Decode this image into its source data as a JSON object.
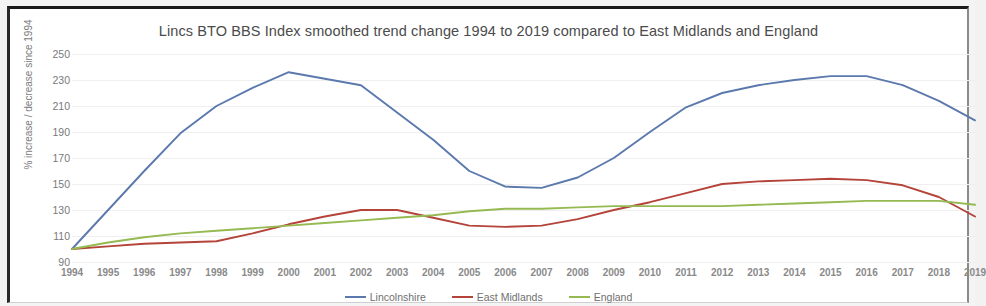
{
  "chart_data": {
    "type": "line",
    "title": "Lincs BTO BBS Index smoothed trend change 1994 to 2019 compared to East Midlands and England",
    "xlabel": "",
    "ylabel": "% increase / decrease since 1994",
    "ylim": [
      90,
      250
    ],
    "ytick_step": 20,
    "yticks": [
      250,
      230,
      210,
      190,
      170,
      150,
      130,
      110,
      90
    ],
    "grid": true,
    "legend_position": "bottom-center",
    "categories": [
      "1994",
      "1995",
      "1996",
      "1997",
      "1998",
      "1999",
      "2000",
      "2001",
      "2002",
      "2003",
      "2004",
      "2005",
      "2006",
      "2007",
      "2008",
      "2009",
      "2010",
      "2011",
      "2012",
      "2013",
      "2014",
      "2015",
      "2016",
      "2017",
      "2018",
      "2019"
    ],
    "series": [
      {
        "name": "Lincolnshire",
        "color": "#5b79ad",
        "values": [
          100,
          130,
          160,
          189,
          210,
          224,
          236,
          231,
          226,
          205,
          184,
          160,
          148,
          147,
          155,
          170,
          190,
          209,
          220,
          226,
          230,
          233,
          233,
          226,
          214,
          199
        ]
      },
      {
        "name": "East Midlands",
        "color": "#b4443a",
        "values": [
          100,
          102,
          104,
          105,
          106,
          112,
          119,
          125,
          130,
          130,
          124,
          118,
          117,
          118,
          123,
          130,
          136,
          143,
          150,
          152,
          153,
          154,
          153,
          149,
          140,
          125
        ]
      },
      {
        "name": "England",
        "color": "#94ba51",
        "values": [
          100,
          105,
          109,
          112,
          114,
          116,
          118,
          120,
          122,
          124,
          126,
          129,
          131,
          131,
          132,
          133,
          133,
          133,
          133,
          134,
          135,
          136,
          137,
          137,
          137,
          134
        ]
      }
    ]
  },
  "legend": {
    "items": [
      {
        "label": "Lincolnshire"
      },
      {
        "label": "East Midlands"
      },
      {
        "label": "England"
      }
    ]
  }
}
